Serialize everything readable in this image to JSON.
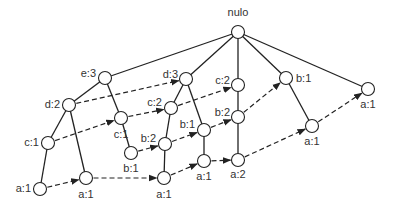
{
  "diagram": {
    "type": "fp-tree",
    "nodes": [
      {
        "id": "root",
        "label": "nulo",
        "x": 238,
        "y": 32,
        "lx": 238,
        "ly": 16,
        "anchor": "middle"
      },
      {
        "id": "e3",
        "label": "e:3",
        "x": 105,
        "y": 78,
        "lx": 96,
        "ly": 77,
        "anchor": "end"
      },
      {
        "id": "d3",
        "label": "d:3",
        "x": 186,
        "y": 79,
        "lx": 178,
        "ly": 78,
        "anchor": "end"
      },
      {
        "id": "c2r",
        "label": "c:2",
        "x": 238,
        "y": 85,
        "lx": 230,
        "ly": 84,
        "anchor": "end"
      },
      {
        "id": "b1r",
        "label": "b:1",
        "x": 286,
        "y": 78,
        "lx": 296,
        "ly": 82,
        "anchor": "start"
      },
      {
        "id": "a1far",
        "label": "a:1",
        "x": 368,
        "y": 89,
        "lx": 368,
        "ly": 108,
        "anchor": "middle"
      },
      {
        "id": "d2",
        "label": "d:2",
        "x": 69,
        "y": 105,
        "lx": 60,
        "ly": 108,
        "anchor": "end"
      },
      {
        "id": "c2m",
        "label": "c:2",
        "x": 171,
        "y": 108,
        "lx": 162,
        "ly": 106,
        "anchor": "end"
      },
      {
        "id": "c1m",
        "label": "c:1",
        "x": 121,
        "y": 118,
        "lx": 121,
        "ly": 138,
        "anchor": "middle"
      },
      {
        "id": "b2m",
        "label": "b:2",
        "x": 165,
        "y": 144,
        "lx": 156,
        "ly": 142,
        "anchor": "end"
      },
      {
        "id": "b1m",
        "label": "b:1",
        "x": 204,
        "y": 130,
        "lx": 195,
        "ly": 128,
        "anchor": "end"
      },
      {
        "id": "b2r",
        "label": "b:2",
        "x": 238,
        "y": 117,
        "lx": 230,
        "ly": 116,
        "anchor": "end"
      },
      {
        "id": "c1l",
        "label": "c:1",
        "x": 48,
        "y": 143,
        "lx": 39,
        "ly": 146,
        "anchor": "end"
      },
      {
        "id": "b1l",
        "label": "b:1",
        "x": 131,
        "y": 153,
        "lx": 131,
        "ly": 172,
        "anchor": "middle"
      },
      {
        "id": "a1l",
        "label": "a:1",
        "x": 40,
        "y": 189,
        "lx": 31,
        "ly": 192,
        "anchor": "end"
      },
      {
        "id": "a1b",
        "label": "a:1",
        "x": 86,
        "y": 178,
        "lx": 86,
        "ly": 198,
        "anchor": "middle"
      },
      {
        "id": "a1c",
        "label": "a:1",
        "x": 164,
        "y": 178,
        "lx": 164,
        "ly": 198,
        "anchor": "middle"
      },
      {
        "id": "a1d",
        "label": "a:1",
        "x": 204,
        "y": 161,
        "lx": 204,
        "ly": 180,
        "anchor": "middle"
      },
      {
        "id": "a2",
        "label": "a:2",
        "x": 238,
        "y": 160,
        "lx": 238,
        "ly": 178,
        "anchor": "middle"
      },
      {
        "id": "a1e",
        "label": "a:1",
        "x": 312,
        "y": 126,
        "lx": 312,
        "ly": 145,
        "anchor": "middle"
      }
    ],
    "tree_edges": [
      [
        "root",
        "e3"
      ],
      [
        "root",
        "d3"
      ],
      [
        "root",
        "c2r"
      ],
      [
        "root",
        "b1r"
      ],
      [
        "root",
        "a1far"
      ],
      [
        "e3",
        "d2"
      ],
      [
        "e3",
        "c1m"
      ],
      [
        "d2",
        "c1l"
      ],
      [
        "d2",
        "a1b"
      ],
      [
        "c1l",
        "a1l"
      ],
      [
        "c1m",
        "b1l"
      ],
      [
        "d3",
        "c2m"
      ],
      [
        "d3",
        "b1m"
      ],
      [
        "c2m",
        "b2m"
      ],
      [
        "b2m",
        "a1c"
      ],
      [
        "b1m",
        "a1d"
      ],
      [
        "c2r",
        "b2r"
      ],
      [
        "b2r",
        "a2"
      ],
      [
        "b1r",
        "a1e"
      ]
    ],
    "link_edges": [
      [
        "d2",
        "d3"
      ],
      [
        "c1l",
        "c1m"
      ],
      [
        "c1m",
        "c2m"
      ],
      [
        "c2m",
        "c2r"
      ],
      [
        "b1l",
        "b2m"
      ],
      [
        "b2m",
        "b1m"
      ],
      [
        "b1m",
        "b2r"
      ],
      [
        "b2r",
        "b1r"
      ],
      [
        "a1l",
        "a1b"
      ],
      [
        "a1b",
        "a1c"
      ],
      [
        "a1c",
        "a1d"
      ],
      [
        "a1d",
        "a2"
      ],
      [
        "a2",
        "a1e"
      ],
      [
        "a1e",
        "a1far"
      ]
    ],
    "style": {
      "node_radius": 6.5,
      "stroke": "#222222",
      "node_fill": "#ffffff",
      "label_color": "#333333"
    }
  }
}
